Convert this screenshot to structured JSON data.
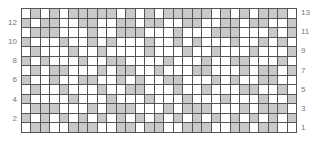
{
  "chart_data": {
    "type": "heatmap",
    "title": "",
    "columns": 29,
    "rows": 13,
    "colors": {
      "filled": "#c9c9c9",
      "empty": "#ffffff",
      "grid": "#555555"
    },
    "row_labels_left": [
      "12",
      "10",
      "8",
      "6",
      "4",
      "2"
    ],
    "row_labels_right": [
      "13",
      "11",
      "9",
      "7",
      "5",
      "3",
      "1"
    ],
    "grid_top_to_bottom": [
      "01010111110101011111010101110",
      "10110011001101100110011011001",
      "01110001001110001000111000101",
      "10001001010001001010001001010",
      "01000100100001000100100010001",
      "10100010011000010001001100010",
      "01011000101100100011000101101",
      "10010011001010011000101001100",
      "01001000100110001001000110010",
      "10000100010001000100010001001",
      "01110001011100010111000101110",
      "10101010101010101010101010101",
      "01100111001101100111001101100"
    ]
  }
}
